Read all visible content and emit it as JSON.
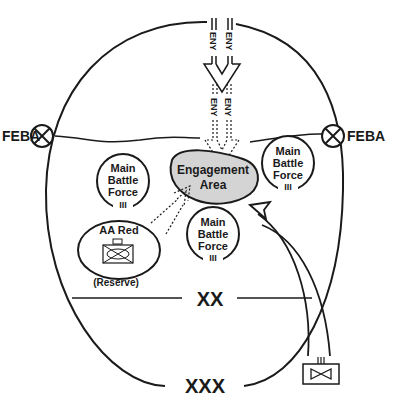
{
  "diagram": {
    "boundary_upper_label": "XX",
    "boundary_lower_label": "XXX",
    "feba_left_label": "FEBA",
    "feba_right_label": "FEBA",
    "enemy_label": "ENY",
    "engagement_area": {
      "line1": "Engagement",
      "line2": "Area",
      "fill": "#d4d4d4"
    },
    "units": [
      {
        "id": "mbf-left",
        "line1": "Main",
        "line2": "Battle",
        "line3": "Force",
        "echelon": "III"
      },
      {
        "id": "mbf-right",
        "line1": "Main",
        "line2": "Battle",
        "line3": "Force",
        "echelon": "III"
      },
      {
        "id": "mbf-center",
        "line1": "Main",
        "line2": "Battle",
        "line3": "Force",
        "echelon": "III"
      }
    ],
    "reserve": {
      "title": "AA Red",
      "caption": "(Reserve)"
    },
    "counterattack_unit": {
      "echelon": "III"
    },
    "colors": {
      "line": "#1a1a1a",
      "background": "#ffffff"
    }
  }
}
